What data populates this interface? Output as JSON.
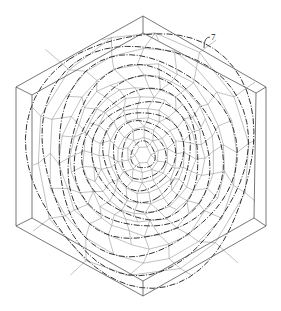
{
  "figure": {
    "type": "patent-style line drawing",
    "reference_label": "7",
    "colors": {
      "background": "#ffffff",
      "outline": "#555555",
      "cells": "#777777",
      "flow_lines": "#1a1a1a"
    },
    "outer_hexagon": [
      [
        143,
        16
      ],
      [
        266,
        87
      ],
      [
        266,
        226
      ],
      [
        143,
        296
      ],
      [
        16,
        226
      ],
      [
        16,
        87
      ]
    ],
    "inner_hexagon": [
      [
        143,
        33
      ],
      [
        256,
        93
      ],
      [
        254,
        218
      ],
      [
        143,
        281
      ],
      [
        32,
        218
      ],
      [
        32,
        95
      ]
    ],
    "center": [
      143,
      155
    ],
    "rings": [
      {
        "r": 8,
        "n": 6
      },
      {
        "r": 16,
        "n": 10
      },
      {
        "r": 25,
        "n": 14
      },
      {
        "r": 34,
        "n": 18
      },
      {
        "r": 43,
        "n": 22
      },
      {
        "r": 52,
        "n": 26
      },
      {
        "r": 61,
        "n": 28
      },
      {
        "r": 71,
        "n": 28
      },
      {
        "r": 82,
        "n": 24
      },
      {
        "r": 95,
        "n": 20
      },
      {
        "r": 108,
        "n": 14
      }
    ],
    "flow_loops": [
      12,
      22,
      31,
      40,
      49,
      58,
      67,
      77,
      89,
      102,
      113
    ],
    "leader": {
      "from": [
        204,
        48
      ],
      "to": [
        210,
        37
      ],
      "label_pos": [
        211,
        40
      ]
    }
  }
}
